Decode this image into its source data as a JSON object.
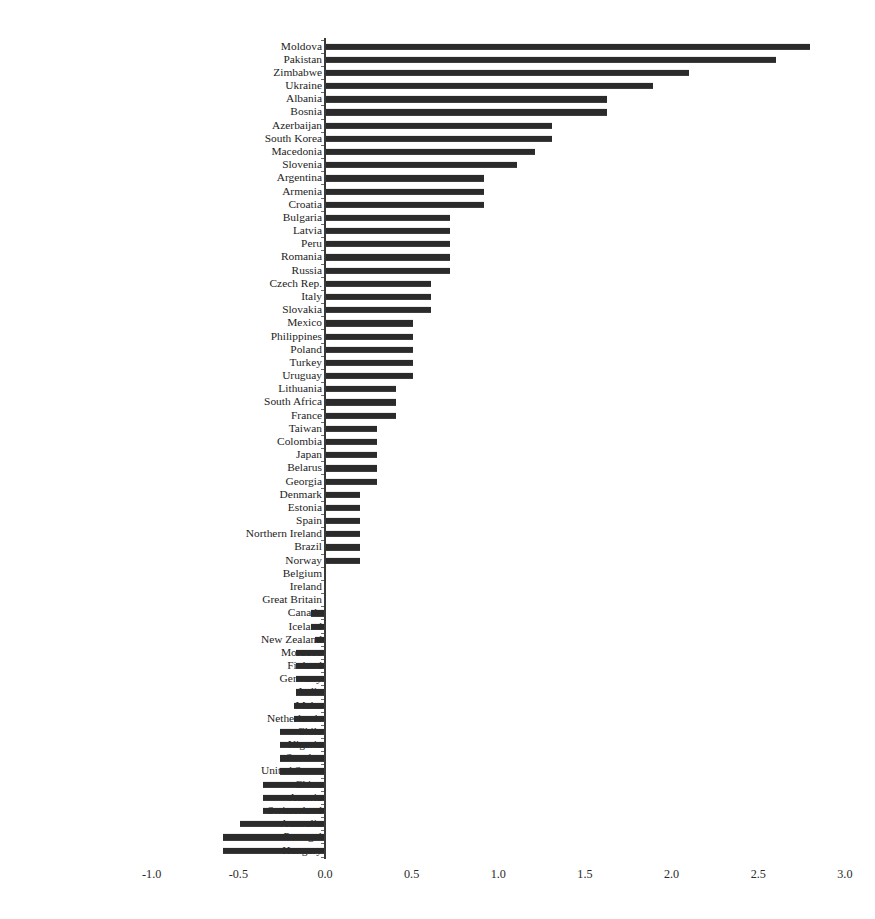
{
  "chart_data": {
    "type": "bar",
    "orientation": "horizontal",
    "title": "",
    "subtitle": "",
    "xlabel": "",
    "ylabel": "",
    "xlim": [
      -1.0,
      3.0
    ],
    "xticks": [
      -1.0,
      -0.5,
      0.0,
      0.5,
      1.0,
      1.5,
      2.0,
      2.5,
      3.0
    ],
    "xtick_labels": [
      "-1.0",
      "-0.5",
      "0.0",
      "0.5",
      "1.0",
      "1.5",
      "2.0",
      "2.5",
      "3.0"
    ],
    "grid": false,
    "legend": null,
    "bar_color": "#2b2b2b",
    "axis_color": "#3a3a3a",
    "categories": [
      "Moldova",
      "Pakistan",
      "Zimbabwe",
      "Ukraine",
      "Albania",
      "Bosnia",
      "Azerbaijan",
      "South Korea",
      "Macedonia",
      "Slovenia",
      "Argentina",
      "Armenia",
      "Croatia",
      "Bulgaria",
      "Latvia",
      "Peru",
      "Romania",
      "Russia",
      "Czech Rep.",
      "Italy",
      "Slovakia",
      "Mexico",
      "Philippines",
      "Poland",
      "Turkey",
      "Uruguay",
      "Lithuania",
      "South Africa",
      "France",
      "Taiwan",
      "Colombia",
      "Japan",
      "Belarus",
      "Georgia",
      "Denmark",
      "Estonia",
      "Spain",
      "Northern Ireland",
      "Brazil",
      "Norway",
      "Belgium",
      "Ireland",
      "Great Britain",
      "Canada",
      "Iceland",
      "New Zealand",
      "Morocco",
      "Finland",
      "Germany",
      "India",
      "Malta",
      "Netherlands",
      "Chile",
      "Nigeria",
      "Sweden",
      "United States",
      "China",
      "Austria",
      "Switzerland",
      "Australia",
      "Portugal",
      "Hungary"
    ],
    "values": [
      2.8,
      2.6,
      2.1,
      1.89,
      1.63,
      1.63,
      1.31,
      1.31,
      1.21,
      1.11,
      0.92,
      0.92,
      0.92,
      0.72,
      0.72,
      0.72,
      0.72,
      0.72,
      0.61,
      0.61,
      0.61,
      0.51,
      0.51,
      0.51,
      0.51,
      0.51,
      0.41,
      0.41,
      0.41,
      0.3,
      0.3,
      0.3,
      0.3,
      0.3,
      0.2,
      0.2,
      0.2,
      0.2,
      0.2,
      0.2,
      0.0,
      0.0,
      0.0,
      -0.08,
      -0.08,
      -0.06,
      -0.17,
      -0.17,
      -0.17,
      -0.17,
      -0.18,
      -0.18,
      -0.26,
      -0.26,
      -0.26,
      -0.26,
      -0.36,
      -0.36,
      -0.36,
      -0.49,
      -0.59,
      -0.59
    ]
  }
}
